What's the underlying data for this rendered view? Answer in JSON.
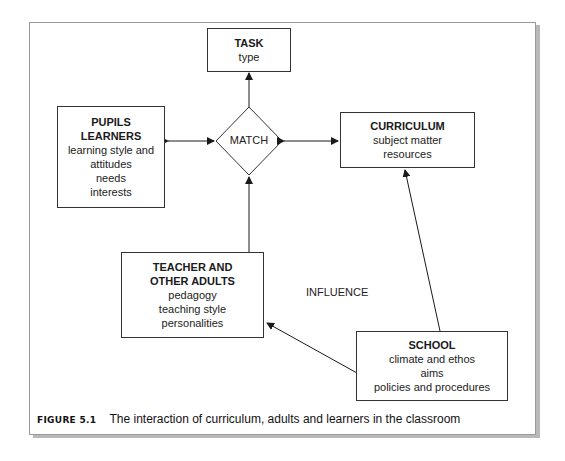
{
  "figure": {
    "caption_label": "FIGURE 5.1",
    "caption_text": "The interaction of curriculum, adults and learners in the classroom"
  },
  "nodes": {
    "task": {
      "title": "TASK",
      "lines": [
        "type"
      ]
    },
    "pupils": {
      "title_lines": [
        "PUPILS",
        "LEARNERS"
      ],
      "lines": [
        "learning style and",
        "attitudes",
        "needs",
        "interests"
      ]
    },
    "match": {
      "label": "MATCH"
    },
    "curriculum": {
      "title": "CURRICULUM",
      "lines": [
        "subject matter",
        "resources"
      ]
    },
    "teacher": {
      "title_lines": [
        "TEACHER AND",
        "OTHER ADULTS"
      ],
      "lines": [
        "pedagogy",
        "teaching style",
        "personalities"
      ]
    },
    "school": {
      "title": "SCHOOL",
      "lines": [
        "climate and ethos",
        "aims",
        "policies and procedures"
      ]
    }
  },
  "annotations": {
    "influence": "INFLUENCE"
  },
  "colors": {
    "line": "#1a1a1a",
    "frame": "#9a9a9a",
    "shadow": "#b9b9b9"
  }
}
